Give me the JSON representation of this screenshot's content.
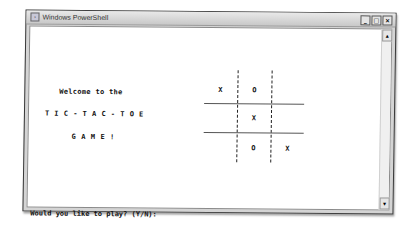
{
  "window": {
    "title": "Windows PowerShell",
    "controls": {
      "minimize": "_",
      "maximize": "□",
      "close": "×"
    },
    "scrollbar": {
      "up": "▲",
      "down": "▼"
    }
  },
  "console": {
    "welcome_line": "Welcome to the",
    "title_line": "TIC-TAC-TOE",
    "game_line": "GAME!",
    "prompt": "Would you like to play? (Y/N):"
  },
  "board": {
    "cells": [
      [
        "X",
        "O",
        ""
      ],
      [
        "",
        "X",
        ""
      ],
      [
        "",
        "O",
        "X"
      ]
    ]
  }
}
